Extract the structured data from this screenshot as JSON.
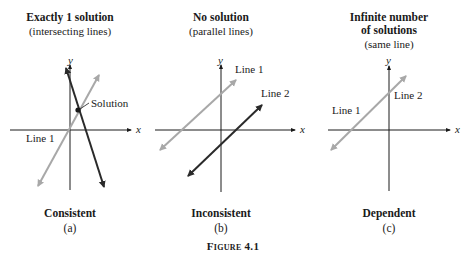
{
  "panels": [
    {
      "id": "a",
      "title_lines": [
        "Exactly 1 solution"
      ],
      "subtitle": "(intersecting lines)",
      "caption": "Consistent",
      "letter": "(a)",
      "labels": {
        "line1": "Line 1",
        "solution": "Solution",
        "x_axis": "x",
        "y_axis": "y"
      }
    },
    {
      "id": "b",
      "title_lines": [
        "No solution"
      ],
      "subtitle": "(parallel lines)",
      "caption": "Inconsistent",
      "letter": "(b)",
      "labels": {
        "line1": "Line 1",
        "line2": "Line 2",
        "x_axis": "x",
        "y_axis": "y"
      }
    },
    {
      "id": "c",
      "title_lines": [
        "Infinite number",
        "of solutions"
      ],
      "subtitle": "(same line)",
      "caption": "Dependent",
      "letter": "(c)",
      "labels": {
        "line1": "Line 1",
        "line2": "Line 2",
        "x_axis": "x",
        "y_axis": "y"
      }
    }
  ],
  "figure_caption": "Figure 4.1",
  "colors": {
    "dark_line": "#2a2a2a",
    "light_line": "#a8a8a8",
    "axis": "#1a1a1a"
  }
}
